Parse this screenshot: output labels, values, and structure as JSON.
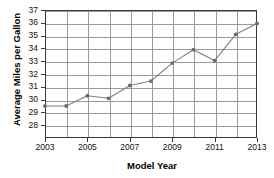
{
  "chart_data": {
    "type": "line",
    "title": "",
    "xlabel": "Model Year",
    "ylabel": "Average Miles per Gallon",
    "x": [
      2003,
      2004,
      2005,
      2006,
      2007,
      2008,
      2009,
      2010,
      2011,
      2012,
      2013
    ],
    "values": [
      29.5,
      29.5,
      30.3,
      30.1,
      31.1,
      31.45,
      32.85,
      33.9,
      33.05,
      35.1,
      35.95
    ],
    "series": [
      {
        "name": "Average Miles per Gallon",
        "values": [
          29.5,
          29.5,
          30.3,
          30.1,
          31.1,
          31.45,
          32.85,
          33.9,
          33.05,
          35.1,
          35.95
        ]
      }
    ],
    "xlim": [
      2003,
      2013
    ],
    "ylim": [
      27,
      37
    ],
    "xticks": [
      2003,
      2005,
      2007,
      2009,
      2011,
      2013
    ],
    "xtick_labels": [
      "2003",
      "2005",
      "2007",
      "2009",
      "2011",
      "2013"
    ],
    "yticks": [
      28,
      29,
      30,
      31,
      32,
      33,
      34,
      35,
      36,
      37
    ],
    "ytick_labels": [
      "28",
      "29",
      "30",
      "31",
      "32",
      "33",
      "34",
      "35",
      "36",
      "37"
    ],
    "grid": true,
    "grid_axes": "both",
    "legend": "none",
    "line_color": "#7f7f7f",
    "marker": "circle",
    "marker_color": "#6b6b6b",
    "axis_color": "#3a3a3a",
    "grid_color": "#9a9a9a",
    "background_color": "#ffffff",
    "note_title_cropped": "title row is cut off at the top edge of the screenshot"
  }
}
